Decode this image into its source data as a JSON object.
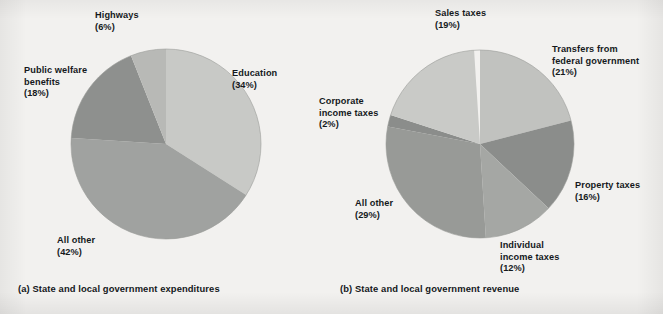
{
  "figure": {
    "background_color": "#f2f1ef",
    "text_color": "#15191c"
  },
  "chart_data": [
    {
      "type": "pie",
      "id": "state-local-expenditures",
      "title": "(a) State and local government expenditures",
      "caption": "(a) State and local government expenditures",
      "categories": [
        "Education",
        "All other",
        "Public welfare benefits",
        "Highways"
      ],
      "values": [
        34,
        42,
        18,
        6
      ],
      "unit": "percent",
      "labels": [
        {
          "name": "Education",
          "pct": "(34%)",
          "value": 34,
          "color": "#c8c9c6"
        },
        {
          "name": "All other",
          "pct": "(42%)",
          "value": 42,
          "color": "#a0a2a0"
        },
        {
          "name": "Public welfare\nbenefits",
          "pct": "(18%)",
          "value": 18,
          "color": "#8e908e"
        },
        {
          "name": "Highways",
          "pct": "(6%)",
          "value": 6,
          "color": "#b8b9b6"
        }
      ],
      "legend": "none",
      "grid": false,
      "start_angle_deg": 0
    },
    {
      "type": "pie",
      "id": "state-local-revenue",
      "title": "(b) State and local government revenue",
      "caption": "(b) State and local government revenue",
      "categories": [
        "Transfers from federal government",
        "Property taxes",
        "Individual income taxes",
        "All other",
        "Corporate income taxes",
        "Sales taxes"
      ],
      "values": [
        21,
        16,
        12,
        29,
        2,
        19
      ],
      "unit": "percent",
      "labels": [
        {
          "name": "Transfers from\nfederal government",
          "pct": "(21%)",
          "value": 21,
          "color": "#c1c2bf"
        },
        {
          "name": "Property taxes",
          "pct": "(16%)",
          "value": 16,
          "color": "#8b8d8b"
        },
        {
          "name": "Individual\nincome taxes",
          "pct": "(12%)",
          "value": 12,
          "color": "#a5a7a4"
        },
        {
          "name": "All other",
          "pct": "(29%)",
          "value": 29,
          "color": "#989a97"
        },
        {
          "name": "Corporate\nincome taxes",
          "pct": "(2%)",
          "value": 2,
          "color": "#8b8d8b"
        },
        {
          "name": "Sales taxes",
          "pct": "(19%)",
          "value": 19,
          "color": "#c9cac7"
        }
      ],
      "legend": "none",
      "grid": false,
      "start_angle_deg": 0
    }
  ],
  "panel_a": {
    "caption": "(a) State and local government expenditures",
    "labels": {
      "highways_name": "Highways",
      "highways_pct": "(6%)",
      "public_welfare_name_line1": "Public welfare",
      "public_welfare_name_line2": "benefits",
      "public_welfare_pct": "(18%)",
      "education_name": "Education",
      "education_pct": "(34%)",
      "all_other_name": "All other",
      "all_other_pct": "(42%)"
    }
  },
  "panel_b": {
    "caption": "(b) State and local government revenue",
    "labels": {
      "sales_taxes_name": "Sales taxes",
      "sales_taxes_pct": "(19%)",
      "transfers_name_line1": "Transfers from",
      "transfers_name_line2": "federal government",
      "transfers_pct": "(21%)",
      "corporate_name_line1": "Corporate",
      "corporate_name_line2": "income taxes",
      "corporate_pct": "(2%)",
      "property_taxes_name": "Property taxes",
      "property_taxes_pct": "(16%)",
      "individual_name_line1": "Individual",
      "individual_name_line2": "income taxes",
      "individual_pct": "(12%)",
      "all_other_name": "All other",
      "all_other_pct": "(29%)"
    }
  }
}
